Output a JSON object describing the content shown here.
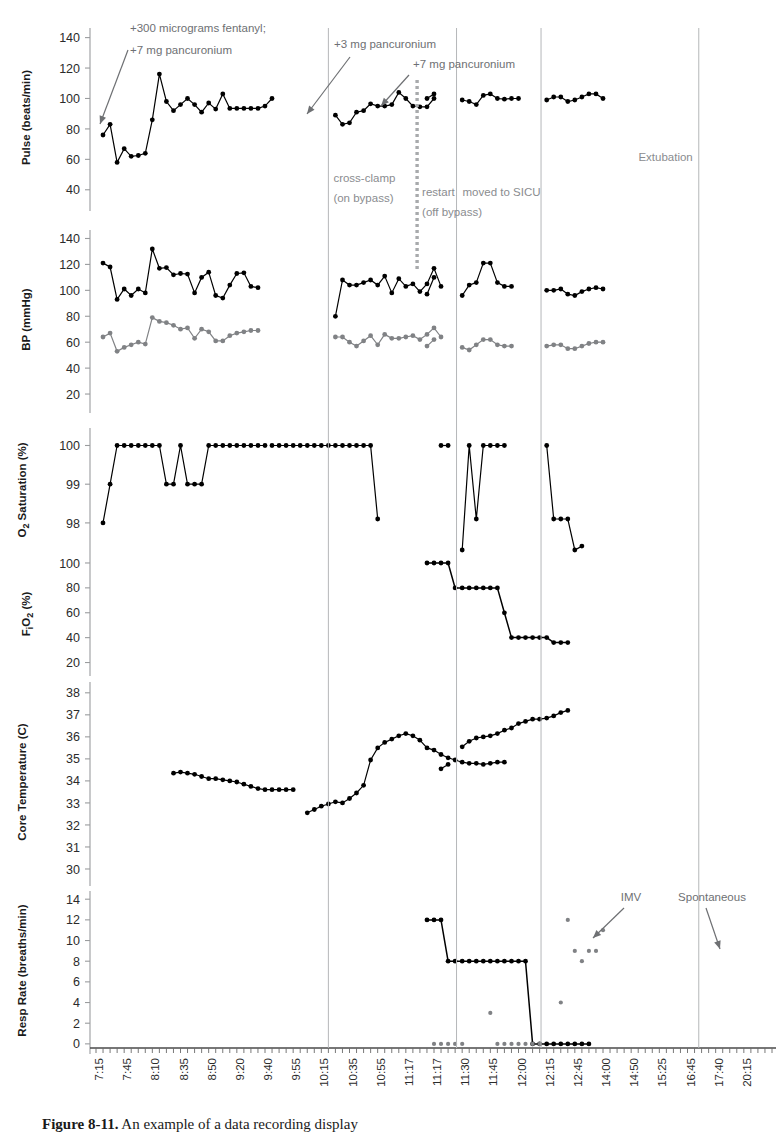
{
  "figure": {
    "caption_label": "Figure 8-11.",
    "caption_text": "An example of a data recording display"
  },
  "chart_data": {
    "type": "line",
    "title": "",
    "multi_panel": true,
    "grid": false,
    "legend_position": "none",
    "xlabel": "",
    "x_tick_labels": [
      "7:15",
      "7:45",
      "8:10",
      "8:35",
      "8:50",
      "9:20",
      "9:40",
      "9:55",
      "10:15",
      "10:35",
      "10:55",
      "11:17",
      "11:17",
      "11:30",
      "11:45",
      "12:00",
      "12:15",
      "12:45",
      "14:00",
      "14:50",
      "15:25",
      "16:45",
      "17:40",
      "20:15"
    ],
    "x_axis_minor_ticks": 96,
    "colors": {
      "series_primary": "#000000",
      "series_secondary": "#808285",
      "annotation": "#6e7073",
      "event_line": "#b5b7b9",
      "event_line_dashed": "#a8aaac"
    },
    "event_markers": [
      {
        "label": "cross-clamp",
        "label2": "(on bypass)",
        "x_time": "9:58",
        "style": "solid"
      },
      {
        "label": "",
        "label2": "",
        "x_time": "10:10",
        "style": "dashed"
      },
      {
        "label": "restart",
        "label2": "(off bypass)",
        "x_time": "11:17",
        "style": "solid"
      },
      {
        "label": "moved to SICU",
        "label2": "",
        "x_time": "12:28",
        "style": "solid"
      },
      {
        "label": "Extubation",
        "label2": "",
        "x_time": "17:55",
        "style": "solid"
      }
    ],
    "drug_annotations": [
      {
        "text_line1": "+300 micrograms  fentanyl;",
        "text_line2": "+7 mg pancuronium",
        "target": "pulse-start"
      },
      {
        "text_line1": "+3 mg pancuronium",
        "text_line2": "",
        "target": "cross-clamp"
      },
      {
        "text_line1": "+7 mg pancuronium",
        "text_line2": "",
        "target": "dashed-line"
      }
    ],
    "panels": [
      {
        "id": "pulse",
        "ylabel": "Pulse (beats/min)",
        "ylim": [
          30,
          145
        ],
        "yticks": [
          40,
          60,
          80,
          100,
          120,
          140
        ],
        "series": [
          {
            "name": "Pulse",
            "color": "#000000",
            "segments": [
              [
                76,
                83,
                58,
                67,
                62,
                62.5,
                64,
                86,
                116,
                98,
                92,
                96,
                100,
                96,
                91,
                97,
                93,
                103,
                93.5,
                93.5,
                93.5,
                93.5,
                93.5,
                95,
                100
              ],
              [
                89,
                83,
                84,
                91,
                92,
                96.5,
                95,
                95,
                96,
                104,
                100,
                95,
                94.5,
                94.5,
                100
              ],
              [
                100,
                103
              ],
              [
                99,
                98,
                96,
                102,
                103,
                100,
                99.5,
                100,
                100
              ],
              [
                99,
                101,
                101,
                98,
                99,
                101,
                103,
                103,
                100
              ]
            ]
          }
        ]
      },
      {
        "id": "bp",
        "ylabel": "BP (mmHg)",
        "ylim": [
          10,
          145
        ],
        "yticks": [
          20,
          40,
          60,
          80,
          100,
          120,
          140
        ],
        "series": [
          {
            "name": "Systolic",
            "color": "#000000",
            "segments": [
              [
                121,
                118,
                93,
                101,
                96,
                101,
                98,
                132,
                117,
                117.5,
                112,
                113,
                112.5,
                98,
                110,
                114,
                96,
                94,
                104,
                113,
                113.5,
                103,
                102
              ],
              [
                80,
                108,
                104,
                104,
                106,
                108,
                104,
                111,
                98,
                109,
                103,
                105,
                99,
                105,
                117,
                103
              ],
              [
                97,
                110
              ],
              [
                96,
                104,
                106,
                121,
                121,
                106,
                103,
                103
              ],
              [
                100,
                100,
                101,
                97,
                96,
                99,
                101,
                102,
                101
              ]
            ]
          },
          {
            "name": "Diastolic",
            "color": "#808285",
            "segments": [
              [
                64,
                67,
                53,
                56,
                58,
                60,
                58.5,
                79,
                76,
                75,
                73,
                70,
                71,
                63,
                70,
                68,
                61,
                61,
                65,
                67,
                68,
                69,
                69
              ],
              [
                64,
                64,
                60,
                57,
                61,
                65,
                58,
                66,
                63,
                63,
                64,
                65,
                62,
                66,
                71,
                64
              ],
              [
                57,
                62
              ],
              [
                56,
                54,
                58,
                62,
                62,
                58,
                57,
                57
              ],
              [
                57,
                58,
                58,
                55,
                55,
                57,
                59,
                60,
                60
              ]
            ]
          }
        ]
      },
      {
        "id": "o2sat",
        "ylabel": "O₂ Saturation (%)",
        "ylim": [
          97.3,
          100.4
        ],
        "yticks": [
          98,
          99,
          100
        ],
        "series": [
          {
            "name": "SpO2",
            "color": "#000000",
            "segments": [
              [
                98,
                99,
                100,
                100,
                100,
                100,
                100,
                100,
                100,
                99,
                99,
                100,
                99,
                99,
                99,
                100,
                100,
                100,
                100,
                100,
                100,
                100,
                100,
                100
              ],
              [
                100,
                100,
                100,
                100,
                100,
                100,
                100,
                100,
                100,
                100,
                100,
                100,
                100,
                100,
                100,
                98.1
              ],
              [
                100,
                100
              ],
              [
                97.3,
                100,
                98.1,
                100,
                100,
                100,
                100
              ],
              [
                100,
                98.1,
                98.1,
                98.1,
                97.3,
                97.4
              ]
            ]
          }
        ]
      },
      {
        "id": "fio2",
        "ylabel": "FᵢO₂ (%)",
        "ylim": [
          14,
          104
        ],
        "yticks": [
          20,
          40,
          60,
          80,
          100
        ],
        "series": [
          {
            "name": "FiO2",
            "color": "#000000",
            "segments": [
              [
                100,
                100,
                100,
                100,
                80,
                80,
                80,
                80,
                80,
                80,
                80,
                60,
                40,
                40,
                40,
                40,
                40,
                40,
                36,
                36,
                36
              ]
            ]
          }
        ]
      },
      {
        "id": "temp",
        "ylabel": "Core Temperature (C)",
        "ylim": [
          29.5,
          38.4
        ],
        "yticks": [
          30,
          31,
          32,
          33,
          34,
          35,
          36,
          37,
          38
        ],
        "series": [
          {
            "name": "Core Temp",
            "color": "#000000",
            "segments": [
              [
                34.35,
                34.4,
                34.35,
                34.3,
                34.2,
                34.1,
                34.1,
                34.05,
                34.0,
                33.95,
                33.85,
                33.75,
                33.65,
                33.6,
                33.6,
                33.6,
                33.6,
                33.6
              ],
              [
                32.55,
                32.7,
                32.85,
                32.95,
                33.05,
                33.0,
                33.2,
                33.45,
                33.8,
                34.95,
                35.5,
                35.75,
                35.9,
                36.05,
                36.15,
                36.05,
                35.85,
                35.5,
                35.4,
                35.2,
                35.05,
                34.95,
                34.85,
                34.8,
                34.8,
                34.75,
                34.8,
                34.85,
                34.85
              ],
              [
                34.55,
                34.75
              ],
              [
                35.55,
                35.8,
                35.95,
                36.0,
                36.05,
                36.15,
                36.3,
                36.4,
                36.6,
                36.7,
                36.8,
                36.8,
                36.85,
                36.95,
                37.1,
                37.2
              ]
            ]
          }
        ]
      },
      {
        "id": "resp",
        "ylabel": "Resp Rate (breaths/min)",
        "ylim": [
          -0.4,
          14.6
        ],
        "yticks": [
          0,
          2,
          4,
          6,
          8,
          10,
          12,
          14
        ],
        "annotations": [
          {
            "label": "IMV"
          },
          {
            "label": "Spontaneous"
          }
        ],
        "series": [
          {
            "name": "IMV rate",
            "color": "#000000",
            "segments": [
              [
                12,
                12,
                12,
                8,
                8,
                8,
                8,
                8,
                8,
                8,
                8,
                8,
                8,
                8,
                8,
                0,
                0,
                0,
                0,
                0,
                0,
                0,
                0,
                0
              ]
            ]
          },
          {
            "name": "Spontaneous rate",
            "color": "#808285",
            "segments": [
              [
                0,
                0,
                0,
                0,
                0
              ],
              [
                3,
                0,
                0,
                0,
                0,
                0,
                0,
                0
              ],
              [
                4,
                12,
                9,
                8,
                9,
                9,
                11
              ]
            ]
          }
        ]
      }
    ]
  }
}
